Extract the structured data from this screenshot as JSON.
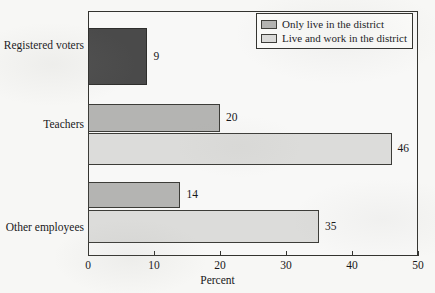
{
  "chart_data": {
    "type": "bar",
    "orientation": "horizontal",
    "title": "",
    "xlabel": "Percent",
    "ylabel": "",
    "xlim": [
      0,
      50
    ],
    "xticks": [
      0,
      10,
      20,
      30,
      40,
      50
    ],
    "xtick_labels": [
      "0",
      "10",
      "20",
      "30",
      "40",
      "50"
    ],
    "grid": false,
    "categories": [
      "Registered voters",
      "Teachers",
      "Other employees"
    ],
    "series": [
      {
        "name": "Only live in the district",
        "color": "#b4b4b2",
        "values": [
          null,
          20,
          14
        ]
      },
      {
        "name": "Live and work in the district",
        "color": "#dcdcda",
        "values": [
          null,
          46,
          35
        ]
      },
      {
        "name": "Registered voters",
        "color": "#4a4a4a",
        "values": [
          9,
          null,
          null
        ]
      }
    ],
    "bars": [
      {
        "category": "Registered voters",
        "series": "Registered voters",
        "value": 9,
        "label": "9",
        "style": "dark",
        "top": 17,
        "height": 57
      },
      {
        "category": "Teachers",
        "series": "Only live in the district",
        "value": 20,
        "label": "20",
        "style": "mid",
        "top": 93,
        "height": 28
      },
      {
        "category": "Teachers",
        "series": "Live and work in the district",
        "value": 46,
        "label": "46",
        "style": "light",
        "top": 122,
        "height": 32
      },
      {
        "category": "Other employees",
        "series": "Only live in the district",
        "value": 14,
        "label": "14",
        "style": "mid",
        "top": 171,
        "height": 26
      },
      {
        "category": "Other employees",
        "series": "Live and work in the district",
        "value": 35,
        "label": "35",
        "style": "light",
        "top": 199,
        "height": 33
      }
    ],
    "category_label_tops": [
      40,
      119,
      222
    ],
    "legend": {
      "position": "top-right",
      "entries": [
        {
          "label": "Only live in the district",
          "style": "mid"
        },
        {
          "label": "Live and work in the district",
          "style": "light"
        }
      ]
    }
  }
}
